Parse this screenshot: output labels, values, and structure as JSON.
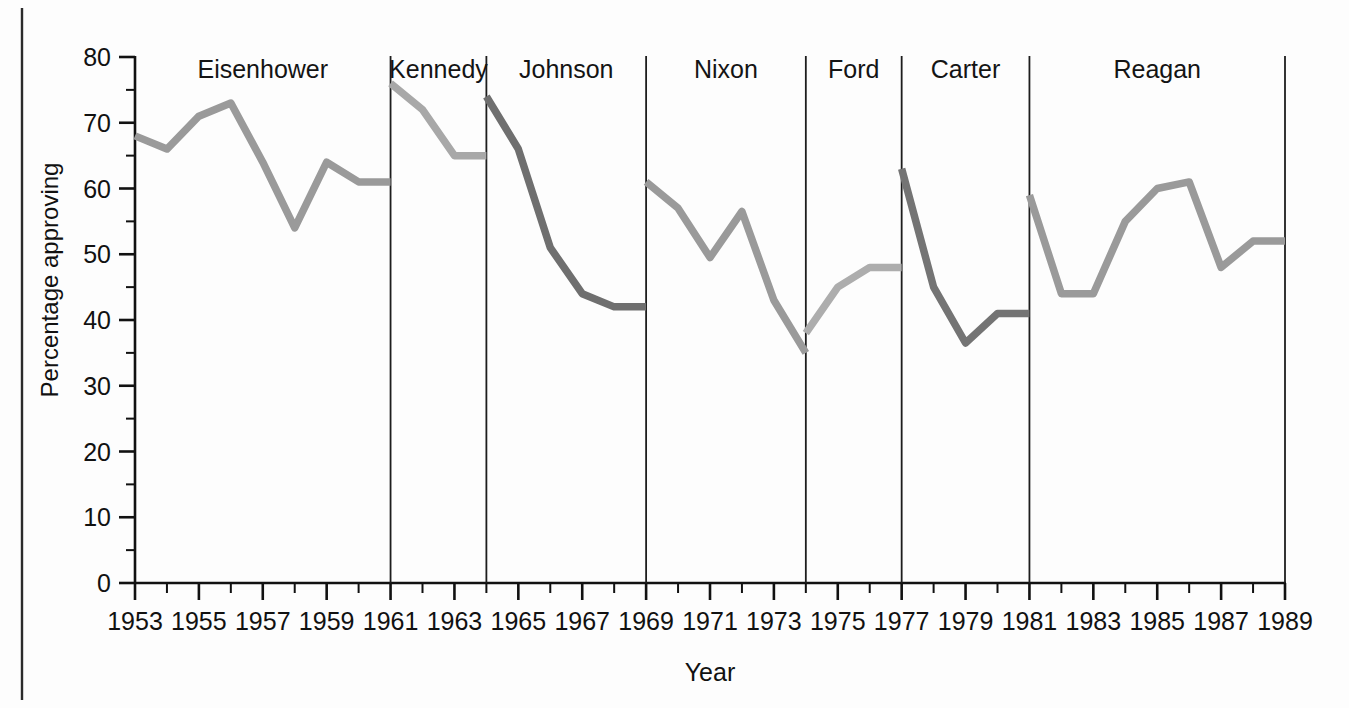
{
  "chart_data": {
    "type": "line",
    "title": "",
    "xlabel": "Year",
    "ylabel": "Percentage approving",
    "xlim": [
      1953,
      1989
    ],
    "ylim": [
      0,
      80
    ],
    "grid": false,
    "legend_position": "none",
    "x_ticks": [
      1953,
      1955,
      1957,
      1959,
      1961,
      1963,
      1965,
      1967,
      1969,
      1971,
      1973,
      1975,
      1977,
      1979,
      1981,
      1983,
      1985,
      1987,
      1989
    ],
    "x_tick_labels": [
      "1953",
      "1955",
      "1957",
      "1959",
      "1961",
      "1963",
      "1965",
      "1967",
      "1969",
      "1971",
      "1973",
      "1975",
      "1977",
      "1979",
      "1981",
      "1983",
      "1985",
      "1987",
      "1989"
    ],
    "x_minor_tick_step": 1,
    "y_ticks": [
      0,
      10,
      20,
      30,
      40,
      50,
      60,
      70,
      80
    ],
    "y_tick_labels": [
      "0",
      "10",
      "20",
      "30",
      "40",
      "50",
      "60",
      "70",
      "80"
    ],
    "y_minor_tick_step": 5,
    "series": [
      {
        "name": "Eisenhower",
        "color": "#9a9a9a",
        "x": [
          1953,
          1954,
          1955,
          1956,
          1957,
          1958,
          1959,
          1960,
          1961
        ],
        "values": [
          68,
          66,
          71,
          73,
          64,
          54,
          64,
          61,
          61
        ]
      },
      {
        "name": "Kennedy",
        "color": "#a8a8a8",
        "x": [
          1961,
          1962,
          1963,
          1964
        ],
        "values": [
          76,
          72,
          65,
          65
        ]
      },
      {
        "name": "Johnson",
        "color": "#6f6f6f",
        "x": [
          1964,
          1965,
          1966,
          1967,
          1968,
          1969
        ],
        "values": [
          74,
          66,
          51,
          44,
          42,
          42
        ]
      },
      {
        "name": "Nixon",
        "color": "#9a9a9a",
        "x": [
          1969,
          1970,
          1971,
          1972,
          1973,
          1974
        ],
        "values": [
          61,
          57,
          49.5,
          56.5,
          43,
          35
        ]
      },
      {
        "name": "Ford",
        "color": "#adadad",
        "x": [
          1974,
          1975,
          1976,
          1977
        ],
        "values": [
          38,
          45,
          48,
          48
        ]
      },
      {
        "name": "Carter",
        "color": "#747474",
        "x": [
          1977,
          1978,
          1979,
          1980,
          1981
        ],
        "values": [
          63,
          45,
          36.5,
          41,
          41
        ]
      },
      {
        "name": "Reagan",
        "color": "#9a9a9a",
        "x": [
          1981,
          1982,
          1983,
          1984,
          1985,
          1986,
          1987,
          1988,
          1989
        ],
        "values": [
          59,
          44,
          44,
          55,
          60,
          61,
          48,
          52,
          52
        ]
      }
    ],
    "term_dividers": [
      1961,
      1964,
      1969,
      1974,
      1977,
      1981
    ],
    "president_labels": [
      {
        "name": "Eisenhower",
        "center_year": 1957.0
      },
      {
        "name": "Kennedy",
        "center_year": 1962.5
      },
      {
        "name": "Johnson",
        "center_year": 1966.5
      },
      {
        "name": "Nixon",
        "center_year": 1971.5
      },
      {
        "name": "Ford",
        "center_year": 1975.5
      },
      {
        "name": "Carter",
        "center_year": 1979.0
      },
      {
        "name": "Reagan",
        "center_year": 1985.0
      }
    ],
    "annotations": []
  },
  "figure": {
    "left_rule_visible": true,
    "background_color": "#fdfdfd",
    "axis_color": "#111111"
  }
}
